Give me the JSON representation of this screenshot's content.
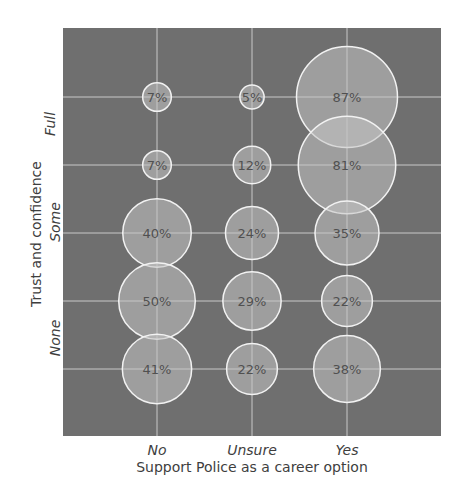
{
  "chart_data": {
    "type": "bubble",
    "title": "",
    "xlabel": "Support Police as a career option",
    "ylabel": "Trust and confidence",
    "x_categories": [
      "No",
      "Unsure",
      "Yes"
    ],
    "y_tick_labels": [
      "Full",
      "Some",
      "None"
    ],
    "rows": 5,
    "row_order": "top-to-bottom",
    "grid": true,
    "cells": [
      {
        "row": 0,
        "col": 0,
        "value": 7,
        "label": "7%"
      },
      {
        "row": 0,
        "col": 1,
        "value": 5,
        "label": "5%"
      },
      {
        "row": 0,
        "col": 2,
        "value": 87,
        "label": "87%"
      },
      {
        "row": 1,
        "col": 0,
        "value": 7,
        "label": "7%"
      },
      {
        "row": 1,
        "col": 1,
        "value": 12,
        "label": "12%"
      },
      {
        "row": 1,
        "col": 2,
        "value": 81,
        "label": "81%"
      },
      {
        "row": 2,
        "col": 0,
        "value": 40,
        "label": "40%"
      },
      {
        "row": 2,
        "col": 1,
        "value": 24,
        "label": "24%"
      },
      {
        "row": 2,
        "col": 2,
        "value": 35,
        "label": "35%"
      },
      {
        "row": 3,
        "col": 0,
        "value": 50,
        "label": "50%"
      },
      {
        "row": 3,
        "col": 1,
        "value": 29,
        "label": "29%"
      },
      {
        "row": 3,
        "col": 2,
        "value": 22,
        "label": "22%"
      },
      {
        "row": 4,
        "col": 0,
        "value": 41,
        "label": "41%"
      },
      {
        "row": 4,
        "col": 1,
        "value": 22,
        "label": "22%"
      },
      {
        "row": 4,
        "col": 2,
        "value": 38,
        "label": "38%"
      }
    ],
    "colors": {
      "plot_background": "#6f6f6f",
      "gridline": "#c9c9c9",
      "bubble_fill": "#c4c4c4",
      "bubble_stroke": "#f2f2f2",
      "bubble_text": "#505050",
      "axis_text": "#3e3e3e"
    }
  },
  "axis": {
    "x_ticks": [
      "No",
      "Unsure",
      "Yes"
    ],
    "x_title": "Support Police as a career option",
    "y_ticks": [
      "Full",
      "Some",
      "None"
    ],
    "y_title": "Trust and confidence"
  }
}
